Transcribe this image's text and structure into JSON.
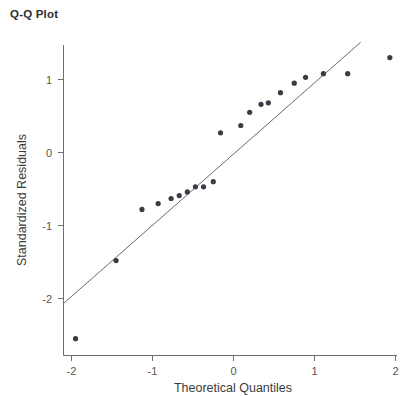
{
  "chart_data": {
    "type": "scatter",
    "title": "Q-Q Plot",
    "xlabel": "Theoretical Quantiles",
    "ylabel": "Standardized Residuals",
    "xlim": [
      -2.15,
      2.15
    ],
    "ylim": [
      -2.75,
      1.55
    ],
    "xticks": [
      -2,
      -1,
      0,
      1,
      2
    ],
    "xticklabels": [
      "-2",
      "-1",
      "0",
      "1",
      "2"
    ],
    "yticks": [
      1,
      0,
      -1,
      -2
    ],
    "yticklabels": [
      "1",
      "0",
      "-1",
      "-2"
    ],
    "grid": false,
    "legend": null,
    "point_color": "#3b3b46",
    "line_color": "#6a6a6a",
    "axis_color": "#6f6f6f",
    "series": [
      {
        "name": "Standardized residuals",
        "x": [
          -1.95,
          -1.45,
          -1.13,
          -0.93,
          -0.77,
          -0.67,
          -0.57,
          -0.47,
          -0.37,
          -0.25,
          -0.16,
          0.09,
          0.2,
          0.34,
          0.43,
          0.58,
          0.75,
          0.89,
          1.11,
          1.41,
          1.93
        ],
        "y": [
          -2.55,
          -1.48,
          -0.78,
          -0.7,
          -0.63,
          -0.59,
          -0.54,
          -0.47,
          -0.47,
          -0.4,
          0.27,
          0.37,
          0.55,
          0.66,
          0.68,
          0.82,
          0.95,
          1.03,
          1.08,
          1.08,
          1.3
        ]
      }
    ],
    "reference_line": {
      "name": "theoretical normal line",
      "x": [
        -2.1,
        1.57
      ],
      "y": [
        -2.07,
        1.51
      ]
    }
  }
}
